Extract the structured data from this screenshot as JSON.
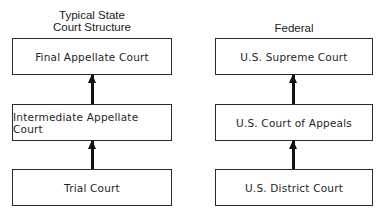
{
  "state": {
    "heading_line1": "Typical State",
    "heading_line2": "Court Structure",
    "levels": [
      {
        "label": "Final Appellate Court"
      },
      {
        "label": "Intermediate Appellate Court"
      },
      {
        "label": "Trial Court"
      }
    ]
  },
  "federal": {
    "heading": "Federal",
    "levels": [
      {
        "label": "U.S. Supreme Court"
      },
      {
        "label": "U.S. Court of Appeals"
      },
      {
        "label": "U.S. District Court"
      }
    ]
  },
  "colors": {
    "line": "#2a2a2a",
    "arrow": "#111111",
    "background": "#ffffff"
  }
}
